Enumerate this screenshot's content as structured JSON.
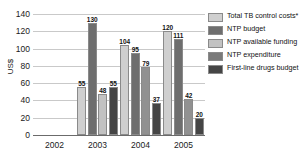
{
  "chart_data": {
    "type": "bar",
    "title": "",
    "subtitle": "",
    "xlabel": "",
    "ylabel": "US$",
    "ylim": [
      0,
      140
    ],
    "yticks": [
      0,
      20,
      40,
      60,
      80,
      100,
      120,
      140
    ],
    "grid": true,
    "legend_position": "right",
    "categories": [
      "2002",
      "2003",
      "2004",
      "2005"
    ],
    "series": [
      {
        "name": "Total TB control costs*",
        "color": "#cfcfcf",
        "values": [
          null,
          55,
          104,
          120
        ]
      },
      {
        "name": "NTP budget",
        "color": "#6e6e6e",
        "values": [
          null,
          130,
          95,
          111
        ]
      },
      {
        "name": "NTP available funding",
        "color": "#c2c2c2",
        "values": [
          null,
          48,
          79,
          42
        ]
      },
      {
        "name": "NTP expenditure",
        "color": "#7a7a7a",
        "values": [
          null,
          null,
          null,
          null
        ]
      },
      {
        "name": "First-line drugs budget",
        "color": "#454545",
        "values": [
          null,
          55,
          37,
          20
        ]
      }
    ],
    "groups": [
      {
        "category": "2002",
        "bars": []
      },
      {
        "category": "2003",
        "bars": [
          {
            "series": "Total TB control costs*",
            "value": 55,
            "label": "55",
            "color": "#cfcfcf"
          },
          {
            "series": "NTP budget",
            "value": 130,
            "label": "130",
            "color": "#6e6e6e"
          },
          {
            "series": "NTP available funding",
            "value": 48,
            "label": "48",
            "color": "#c2c2c2"
          },
          {
            "series": "First-line drugs budget",
            "value": 55,
            "label": "55",
            "color": "#454545"
          }
        ]
      },
      {
        "category": "2004",
        "bars": [
          {
            "series": "Total TB control costs*",
            "value": 104,
            "label": "104",
            "color": "#cfcfcf"
          },
          {
            "series": "NTP budget",
            "value": 95,
            "label": "95",
            "color": "#6e6e6e"
          },
          {
            "series": "NTP available funding",
            "value": 79,
            "label": "79",
            "color": "#919191"
          },
          {
            "series": "First-line drugs budget",
            "value": 37,
            "label": "37",
            "color": "#454545"
          }
        ]
      },
      {
        "category": "2005",
        "bars": [
          {
            "series": "Total TB control costs*",
            "value": 120,
            "label": "120",
            "color": "#cfcfcf"
          },
          {
            "series": "NTP budget",
            "value": 111,
            "label": "111",
            "color": "#6e6e6e"
          },
          {
            "series": "NTP available funding",
            "value": 42,
            "label": "42",
            "color": "#919191"
          },
          {
            "series": "First-line drugs budget",
            "value": 20,
            "label": "20",
            "color": "#454545"
          }
        ]
      }
    ]
  },
  "legend": {
    "items": [
      {
        "label": "Total TB control costs*",
        "color": "#cfcfcf"
      },
      {
        "label": "NTP budget",
        "color": "#6e6e6e"
      },
      {
        "label": "NTP available funding",
        "color": "#c2c2c2"
      },
      {
        "label": "NTP expenditure",
        "color": "#7a7a7a"
      },
      {
        "label": "First-line drugs budget",
        "color": "#454545"
      }
    ]
  }
}
